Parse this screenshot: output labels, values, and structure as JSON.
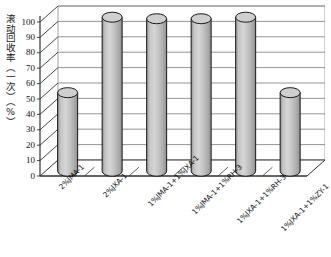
{
  "chart_data": {
    "type": "bar",
    "title": "",
    "subtitle": "",
    "xlabel": "",
    "ylabel": "滚动回收率（一次）（%）",
    "categories": [
      "2%JMA-1",
      "2%JXA-1",
      "1%JMA-1+1%JXA-1",
      "1%JMA-1+1%RH-3",
      "1%JXA-1+1%RH-3",
      "1%JXA-1+1%ZY-1"
    ],
    "values": [
      51,
      100,
      99,
      99,
      100,
      51
    ],
    "ylim": [
      0,
      100
    ],
    "ytick_labels": [
      "0",
      "10",
      "20",
      "30",
      "40",
      "50",
      "60",
      "70",
      "80",
      "90",
      "100"
    ],
    "ytick_values": [
      0,
      10,
      20,
      30,
      40,
      50,
      60,
      70,
      80,
      90,
      100
    ],
    "grid": true,
    "legend": "none",
    "style": "3d-cylinder",
    "series_name": "滚动回收率（一次）",
    "bar_fill_color": "#b9b9b9",
    "bar_edge_color": "#1a1a1a",
    "bar_top_color": "#cfcfcf",
    "axis_color": "#333333",
    "grid_color": "#8a8a8a",
    "background_color": "#ffffff"
  }
}
